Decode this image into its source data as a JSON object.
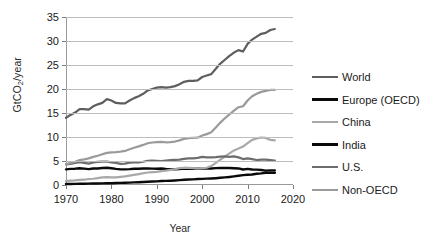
{
  "chart_data": {
    "type": "line",
    "title": "",
    "xlabel": "Year",
    "ylabel": "GtCO2/year",
    "ylabel_parts": {
      "prefix": "GtCO",
      "sub": "2",
      "suffix": "/year"
    },
    "xlim": [
      1970,
      2020
    ],
    "ylim": [
      0,
      35
    ],
    "xticks": [
      1970,
      1980,
      1990,
      2000,
      2010,
      2020
    ],
    "yticks": [
      0,
      5,
      10,
      15,
      20,
      25,
      30,
      35
    ],
    "grid": "horizontal",
    "legend_position": "right",
    "x": [
      1970,
      1971,
      1972,
      1973,
      1974,
      1975,
      1976,
      1977,
      1978,
      1979,
      1980,
      1981,
      1982,
      1983,
      1984,
      1985,
      1986,
      1987,
      1988,
      1989,
      1990,
      1991,
      1992,
      1993,
      1994,
      1995,
      1996,
      1997,
      1998,
      1999,
      2000,
      2001,
      2002,
      2003,
      2004,
      2005,
      2006,
      2007,
      2008,
      2009,
      2010,
      2011,
      2012,
      2013,
      2014,
      2015,
      2016
    ],
    "series": [
      {
        "name": "World",
        "color": "#5e5e5e",
        "width": 2.2,
        "values": [
          14.0,
          14.6,
          15.1,
          15.8,
          15.8,
          15.7,
          16.4,
          16.8,
          17.1,
          17.9,
          17.6,
          17.1,
          17.0,
          17.0,
          17.6,
          18.1,
          18.5,
          19.0,
          19.7,
          20.0,
          20.3,
          20.4,
          20.3,
          20.4,
          20.6,
          21.0,
          21.5,
          21.7,
          21.7,
          21.8,
          22.5,
          22.8,
          23.1,
          24.2,
          25.3,
          26.1,
          26.9,
          27.6,
          28.1,
          27.8,
          29.4,
          30.3,
          30.9,
          31.5,
          31.7,
          32.3,
          32.5
        ]
      },
      {
        "name": "Europe (OECD)",
        "color": "#0a0a0a",
        "width": 2.4,
        "values": [
          3.25,
          3.35,
          3.4,
          3.5,
          3.42,
          3.3,
          3.45,
          3.45,
          3.55,
          3.6,
          3.5,
          3.35,
          3.25,
          3.25,
          3.3,
          3.38,
          3.4,
          3.45,
          3.45,
          3.42,
          3.4,
          3.45,
          3.35,
          3.3,
          3.28,
          3.32,
          3.42,
          3.38,
          3.4,
          3.38,
          3.42,
          3.48,
          3.45,
          3.52,
          3.55,
          3.55,
          3.55,
          3.5,
          3.45,
          3.22,
          3.35,
          3.22,
          3.2,
          3.12,
          3.0,
          3.05,
          3.05
        ]
      },
      {
        "name": "China",
        "color": "#a8a8a8",
        "width": 2.2,
        "values": [
          0.8,
          0.9,
          0.95,
          1.05,
          1.1,
          1.25,
          1.3,
          1.45,
          1.6,
          1.65,
          1.6,
          1.6,
          1.7,
          1.8,
          1.95,
          2.1,
          2.25,
          2.45,
          2.6,
          2.7,
          2.75,
          2.9,
          3.0,
          3.15,
          3.3,
          3.5,
          3.6,
          3.55,
          3.5,
          3.4,
          3.5,
          3.6,
          3.95,
          4.6,
          5.3,
          5.9,
          6.6,
          7.2,
          7.6,
          8.0,
          8.7,
          9.4,
          9.7,
          9.9,
          9.8,
          9.4,
          9.3
        ]
      },
      {
        "name": "India",
        "color": "#0a0a0a",
        "width": 2.4,
        "values": [
          0.2,
          0.22,
          0.23,
          0.25,
          0.26,
          0.28,
          0.3,
          0.32,
          0.34,
          0.37,
          0.38,
          0.41,
          0.44,
          0.47,
          0.5,
          0.54,
          0.58,
          0.62,
          0.67,
          0.72,
          0.76,
          0.82,
          0.86,
          0.9,
          0.95,
          1.02,
          1.08,
          1.14,
          1.18,
          1.25,
          1.28,
          1.32,
          1.36,
          1.42,
          1.5,
          1.58,
          1.68,
          1.8,
          1.92,
          2.05,
          2.12,
          2.2,
          2.35,
          2.42,
          2.55,
          2.55,
          2.55
        ]
      },
      {
        "name": "U.S.",
        "color": "#6d6d6d",
        "width": 2.2,
        "values": [
          4.3,
          4.4,
          4.6,
          4.75,
          4.6,
          4.45,
          4.7,
          4.8,
          4.85,
          4.9,
          4.7,
          4.6,
          4.4,
          4.45,
          4.65,
          4.7,
          4.7,
          4.85,
          5.05,
          5.1,
          5.05,
          5.0,
          5.1,
          5.2,
          5.25,
          5.3,
          5.45,
          5.55,
          5.55,
          5.65,
          5.85,
          5.75,
          5.75,
          5.8,
          5.9,
          5.95,
          5.85,
          5.95,
          5.75,
          5.4,
          5.55,
          5.4,
          5.2,
          5.3,
          5.3,
          5.2,
          5.1
        ]
      },
      {
        "name": "Non-OECD",
        "color": "#9a9a9a",
        "width": 2.2,
        "values": [
          4.3,
          4.6,
          4.85,
          5.2,
          5.35,
          5.55,
          5.85,
          6.1,
          6.4,
          6.7,
          6.8,
          6.85,
          6.95,
          7.1,
          7.45,
          7.75,
          8.05,
          8.35,
          8.7,
          8.85,
          8.95,
          9.0,
          8.9,
          8.95,
          9.05,
          9.3,
          9.6,
          9.75,
          9.8,
          9.85,
          10.3,
          10.6,
          11.0,
          12.0,
          13.0,
          13.9,
          14.7,
          15.5,
          16.2,
          16.4,
          17.6,
          18.5,
          19.0,
          19.4,
          19.6,
          19.8,
          19.8
        ]
      }
    ]
  },
  "legend": {
    "items": [
      {
        "label": "World",
        "color": "#5e5e5e",
        "width": 2.4
      },
      {
        "label": "Europe (OECD)",
        "color": "#0a0a0a",
        "width": 3.0
      },
      {
        "label": "China",
        "color": "#a8a8a8",
        "width": 2.4
      },
      {
        "label": "India",
        "color": "#0a0a0a",
        "width": 3.0
      },
      {
        "label": "U.S.",
        "color": "#6d6d6d",
        "width": 2.4
      },
      {
        "label": "Non-OECD",
        "color": "#9a9a9a",
        "width": 2.4
      }
    ]
  }
}
